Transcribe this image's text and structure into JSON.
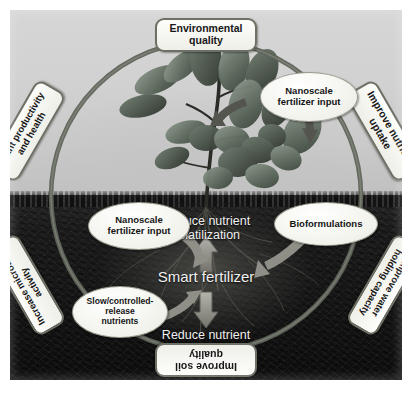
{
  "figure": {
    "type": "conceptual-cycle-diagram",
    "subject": "Smart fertilizer",
    "colors": {
      "ring": "#6d7064",
      "tag_border": "#6d7064",
      "tag_fill": "#f5f5ef",
      "oval_fill": "#f7f7f1",
      "sky": "#d2d2d2",
      "soil": "#151515",
      "center_text": "#f0f0f0",
      "arrow": "#8f8f8a"
    }
  },
  "center": {
    "title": "Smart fertilizer",
    "top_label_line1": "Reduce nutrient",
    "top_label_line2": "volatilization",
    "bottom_label_line1": "Reduce nutrient",
    "bottom_label_line2": "leaching"
  },
  "ring_tags": [
    {
      "id": "environmental-quality",
      "line1": "Environmental",
      "line2": "quality",
      "rotation_deg": 0
    },
    {
      "id": "improve-nutrient-uptake",
      "line1": "Improve nutrient",
      "line2": "uptake",
      "rotation_deg": 60
    },
    {
      "id": "improve-water-holding-capacity",
      "line1": "Improve water",
      "line2": "holding capacity",
      "rotation_deg": 120
    },
    {
      "id": "improve-soil-quality",
      "line1": "Improve soil",
      "line2": "quality",
      "rotation_deg": 180
    },
    {
      "id": "increase-microbial-activity",
      "line1": "Increase microbial",
      "line2": "activity",
      "rotation_deg": 240
    },
    {
      "id": "plant-productivity-and-health",
      "line1": "Plant productivity",
      "line2": "and health",
      "rotation_deg": 300
    }
  ],
  "input_ovals": [
    {
      "id": "nanoscale-fertilizer-input-top",
      "line1": "Nanoscale",
      "line2": "fertilizer input",
      "line3": ""
    },
    {
      "id": "nanoscale-fertilizer-input-soil",
      "line1": "Nanoscale",
      "line2": "fertilizer input",
      "line3": ""
    },
    {
      "id": "bioformulations",
      "line1": "Bioformulations",
      "line2": "",
      "line3": ""
    },
    {
      "id": "slow-controlled-release-nutrients",
      "line1": "Slow/controlled-",
      "line2": "release",
      "line3": "nutrients"
    }
  ]
}
